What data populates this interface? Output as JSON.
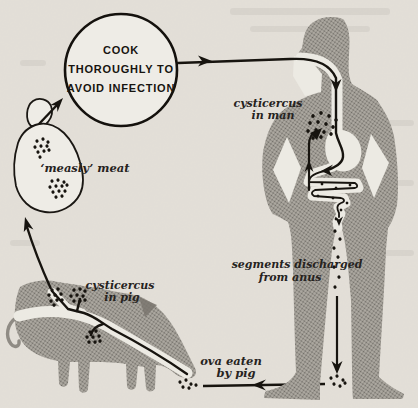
{
  "figure": {
    "type": "life-cycle-diagram",
    "circle_warning": {
      "line1": "COOK",
      "line2": "THOROUGHLY TO",
      "line3": "AVOID INFECTION"
    },
    "labels": {
      "measly_meat": "‘measly’ meat",
      "cyst_man_1": "cysticercus",
      "cyst_man_2": "in man",
      "cyst_pig_1": "cysticercus",
      "cyst_pig_2": "in pig",
      "segments_1": "segments discharged",
      "segments_2": "from anus",
      "ova_1": "ova eaten",
      "ova_2": "by pig"
    },
    "colors": {
      "paper": "#e8e4dd",
      "silhouette_gray": "#999590",
      "line_black": "#17140f",
      "cutout_white": "#eceae3"
    }
  }
}
